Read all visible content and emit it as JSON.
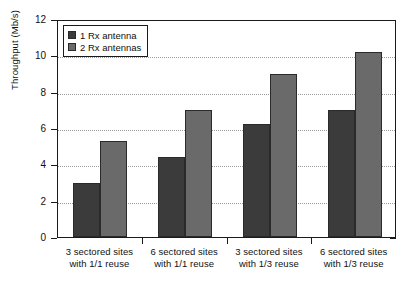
{
  "chart_data": {
    "type": "bar",
    "title": "",
    "xlabel": "",
    "ylabel": "Throughput (Mb/s)",
    "ylim": [
      0,
      12
    ],
    "ytick_labels": [
      "0",
      "2",
      "4",
      "6",
      "8",
      "10",
      "12"
    ],
    "ytick_values": [
      0,
      2,
      4,
      6,
      8,
      10,
      12
    ],
    "grid": true,
    "grid_axis": "y",
    "legend_position": "top-left",
    "categories": [
      "3 sectored sites with 1/1 reuse",
      "6 sectored sites with 1/1 reuse",
      "3 sectored sites with 1/3 reuse",
      "6 sectored sites with 1/3 reuse"
    ],
    "category_lines": [
      [
        "3 sectored sites",
        "with 1/1 reuse"
      ],
      [
        "6 sectored sites",
        "with 1/1 reuse"
      ],
      [
        "3 sectored sites",
        "with 1/3 reuse"
      ],
      [
        "6 sectored sites",
        "with 1/3 reuse"
      ]
    ],
    "series": [
      {
        "name": "1 Rx antenna",
        "color": "#3b3b3b",
        "values": [
          3.0,
          4.4,
          6.2,
          7.0
        ]
      },
      {
        "name": "2 Rx antennas",
        "color": "#6a6a6a",
        "values": [
          5.3,
          7.0,
          9.0,
          10.2
        ]
      }
    ]
  }
}
